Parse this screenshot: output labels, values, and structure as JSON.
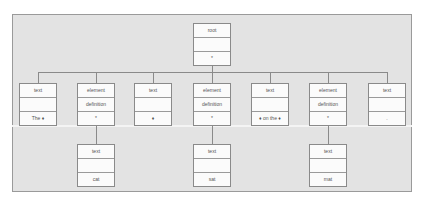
{
  "diagram": {
    "root": {
      "rows": [
        "root",
        "",
        "*"
      ]
    },
    "level2": [
      {
        "rows": [
          "text",
          "",
          "The ♦"
        ]
      },
      {
        "rows": [
          "element",
          "definition",
          "*"
        ]
      },
      {
        "rows": [
          "text",
          "",
          "♦"
        ]
      },
      {
        "rows": [
          "element",
          "definition",
          "*"
        ]
      },
      {
        "rows": [
          "text",
          "",
          "♦ on the ♦"
        ]
      },
      {
        "rows": [
          "element",
          "definition",
          "*"
        ]
      },
      {
        "rows": [
          "text",
          "",
          "."
        ]
      }
    ],
    "level3": [
      {
        "parent_index": 1,
        "rows": [
          "text",
          "",
          "cat"
        ]
      },
      {
        "parent_index": 3,
        "rows": [
          "text",
          "",
          "sat"
        ]
      },
      {
        "parent_index": 5,
        "rows": [
          "text",
          "",
          "mat"
        ]
      }
    ],
    "colors": {
      "panel_bg": "#e3e3e3",
      "panel_border": "#9a9a9a",
      "node_bg": "#fbfbfb",
      "node_border": "#8a8a8a",
      "text": "#555555"
    }
  }
}
